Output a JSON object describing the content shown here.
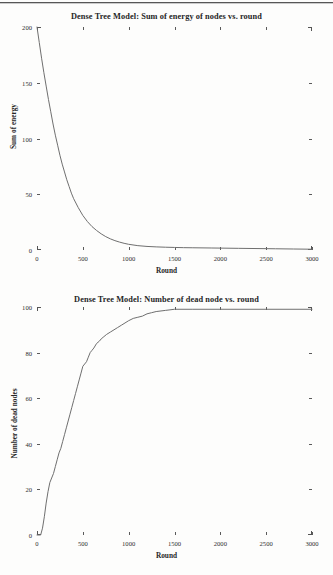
{
  "page": {
    "background": "#fdfdfc",
    "ink": "#2b2b2b",
    "line_color": "#6f6f6f"
  },
  "chart_data": [
    {
      "type": "line",
      "title": "Dense Tree Model: Sum of energy of nodes vs. round",
      "xlabel": "Round",
      "ylabel": "Sum of energy",
      "xlim": [
        0,
        3000
      ],
      "ylim": [
        0,
        200
      ],
      "xticks": [
        0,
        500,
        1000,
        1500,
        2000,
        2500,
        3000
      ],
      "xticklabels": [
        "0",
        "500",
        "1000",
        "1500",
        "2000",
        "2500",
        "3000"
      ],
      "yticks": [
        0,
        50,
        100,
        150,
        200
      ],
      "yticklabels": [
        "0",
        "50",
        "100",
        "150",
        "200"
      ],
      "grid": false,
      "legend": false,
      "series": [
        {
          "name": "Sum of energy",
          "x": [
            0,
            25,
            50,
            75,
            100,
            125,
            150,
            175,
            200,
            225,
            250,
            275,
            300,
            325,
            350,
            375,
            400,
            450,
            500,
            550,
            600,
            650,
            700,
            750,
            800,
            850,
            900,
            950,
            1000,
            1100,
            1200,
            1300,
            1400,
            1500,
            1600,
            1700,
            1800,
            1900,
            2000,
            2200,
            2400,
            2600,
            2800,
            3000
          ],
          "y": [
            200,
            186,
            172,
            159,
            147,
            135,
            124,
            113,
            103,
            94,
            85,
            77,
            70,
            63,
            57,
            51,
            46,
            38,
            31,
            25.5,
            21,
            17.5,
            14.5,
            12,
            10,
            8.4,
            7.1,
            6.0,
            5.1,
            3.9,
            3.2,
            2.8,
            2.5,
            2.3,
            2.1,
            2.0,
            1.9,
            1.8,
            1.7,
            1.5,
            1.3,
            1.1,
            0.9,
            0.7
          ]
        }
      ]
    },
    {
      "type": "line",
      "title": "Dense Tree Model: Number of dead node vs. round",
      "xlabel": "Round",
      "ylabel": "Number of dead nodes",
      "xlim": [
        0,
        3000
      ],
      "ylim": [
        0,
        100
      ],
      "xticks": [
        0,
        500,
        1000,
        1500,
        2000,
        2500,
        3000
      ],
      "xticklabels": [
        "0",
        "500",
        "1000",
        "1500",
        "2000",
        "2500",
        "3000"
      ],
      "yticks": [
        0,
        20,
        40,
        60,
        80,
        100
      ],
      "yticklabels": [
        "0",
        "20",
        "40",
        "60",
        "80",
        "100"
      ],
      "grid": false,
      "legend": false,
      "series": [
        {
          "name": "Number of dead nodes",
          "x": [
            0,
            40,
            60,
            80,
            100,
            120,
            140,
            160,
            180,
            200,
            220,
            240,
            260,
            280,
            300,
            320,
            340,
            360,
            380,
            400,
            420,
            440,
            460,
            480,
            500,
            520,
            540,
            560,
            580,
            600,
            620,
            650,
            680,
            700,
            730,
            760,
            800,
            840,
            880,
            920,
            960,
            1000,
            1050,
            1100,
            1150,
            1200,
            1250,
            1300,
            1400,
            1500,
            1700,
            2000,
            2500,
            3000
          ],
          "y": [
            0,
            0,
            3,
            8,
            14,
            19,
            23,
            25,
            27,
            30,
            33,
            36,
            38,
            41,
            44,
            47,
            50,
            53,
            56,
            59,
            62,
            65,
            68,
            71,
            74,
            75,
            76,
            78,
            80,
            81,
            82,
            84,
            85,
            86,
            87,
            88,
            89,
            90,
            91,
            92,
            93,
            94,
            95,
            95.5,
            96,
            97,
            97.5,
            98,
            98.5,
            99,
            99,
            99,
            99,
            99
          ]
        }
      ]
    }
  ]
}
